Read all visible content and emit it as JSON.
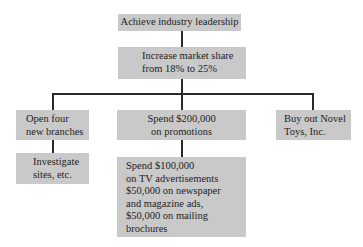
{
  "diagram": {
    "type": "hierarchy",
    "goal": {
      "text": "Achieve industry leadership"
    },
    "objective": {
      "lines": [
        "Increase market share",
        "from 18% to 25%"
      ]
    },
    "strategies": [
      {
        "lines": [
          "Open four",
          "new branches"
        ],
        "children": [
          {
            "lines": [
              "Investigate",
              "sites, etc."
            ]
          }
        ]
      },
      {
        "lines": [
          "Spend $200,000",
          "on promotions"
        ],
        "children": [
          {
            "lines": [
              "Spend $100,000",
              "on TV advertisements",
              "$50,000 on newspaper",
              "and magazine ads,",
              "$50,000 on mailing",
              "brochures"
            ]
          }
        ]
      },
      {
        "lines": [
          "Buy out Novel",
          "Toys, Inc."
        ],
        "children": []
      }
    ]
  },
  "colors": {
    "box_fill": "#c9c9c9",
    "connector": "#2a2a2a",
    "background": "#ffffff"
  }
}
